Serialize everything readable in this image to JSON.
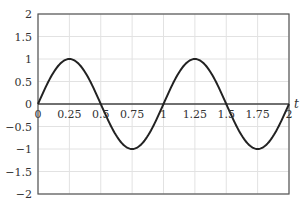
{
  "chart_data": {
    "type": "line",
    "title": "",
    "xlabel": "t",
    "ylabel": "",
    "xlim": [
      0,
      2
    ],
    "ylim": [
      -2,
      2
    ],
    "grid": true,
    "x_ticks": [
      "0",
      "0.25",
      "0.5",
      "0.75",
      "1",
      "1.25",
      "1.5",
      "1.75",
      "2"
    ],
    "y_ticks": [
      "2",
      "1.5",
      "1",
      "0.5",
      "0",
      "−0.5",
      "−1",
      "−1.5",
      "−2"
    ],
    "series": [
      {
        "name": "sin(2πt)",
        "function": "sin(2*pi*t)",
        "x": [
          0,
          0.25,
          0.5,
          0.75,
          1,
          1.25,
          1.5,
          1.75,
          2
        ],
        "values": [
          0,
          1,
          0,
          -1,
          0,
          1,
          0,
          -1,
          0
        ],
        "color": "#222222"
      }
    ]
  }
}
